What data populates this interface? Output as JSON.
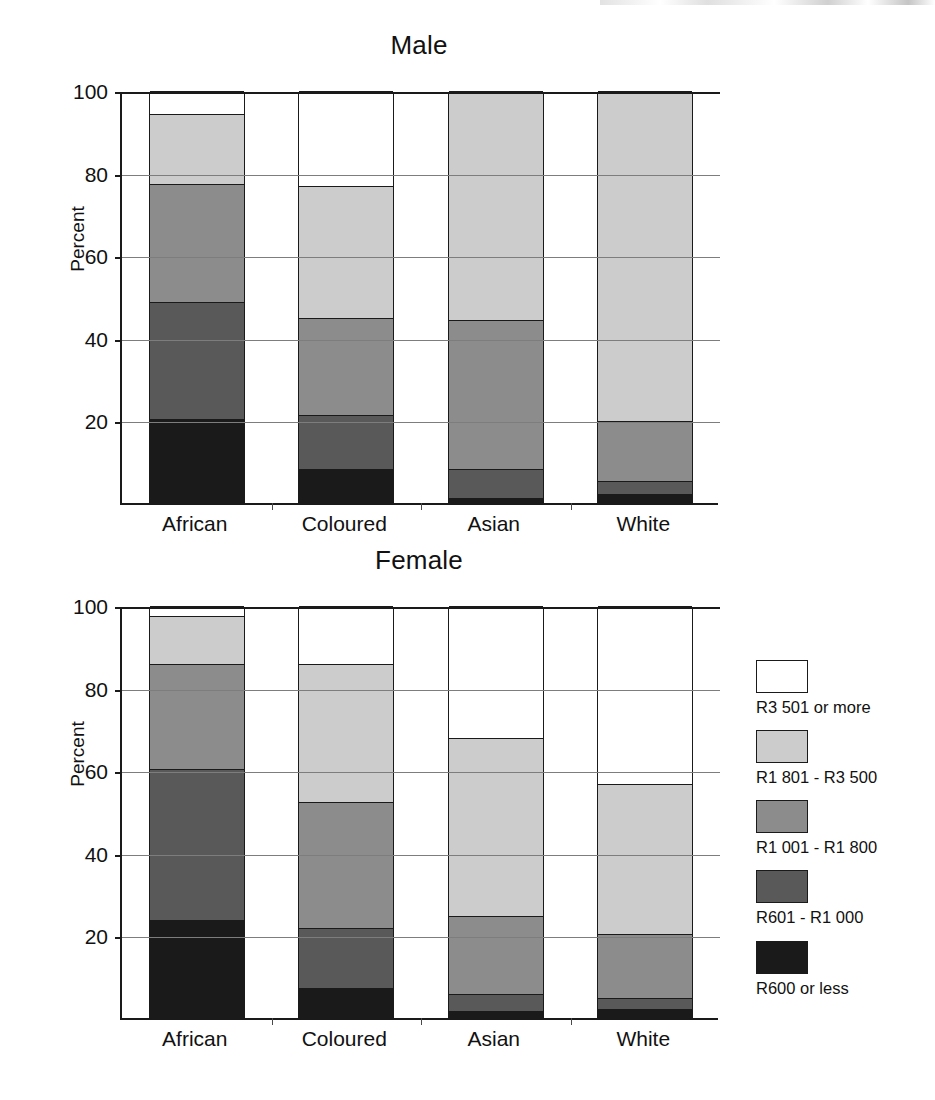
{
  "chart_data": {
    "type": "bar",
    "subtype": "stacked-bar-percent",
    "title": "",
    "panels": [
      {
        "id": "male",
        "title": "Male"
      },
      {
        "id": "female",
        "title": "Female"
      }
    ],
    "categories": [
      "African",
      "Coloured",
      "Asian",
      "White"
    ],
    "xlabel": "",
    "ylabel": "Percent",
    "ylim": [
      0,
      100
    ],
    "yticks": [
      20,
      40,
      60,
      80,
      100
    ],
    "ytick_labels": [
      "20",
      "40",
      "60",
      "80",
      "100"
    ],
    "grid": "horizontal",
    "legend_position": "right",
    "legend_order": "top-to-bottom",
    "series": [
      {
        "name": "R600 or less",
        "color": "#1a1a1a",
        "stack_order": 1,
        "male": [
          20.5,
          8.5,
          1.5,
          2.5
        ],
        "female": [
          24.0,
          7.5,
          2.0,
          2.5
        ]
      },
      {
        "name": "R601 -  R1 000",
        "color": "#595959",
        "stack_order": 2,
        "male": [
          28.5,
          13.0,
          7.0,
          3.0
        ],
        "female": [
          36.5,
          14.5,
          4.0,
          2.5
        ]
      },
      {
        "name": "R1 001 - R1 800",
        "color": "#8c8c8c",
        "stack_order": 3,
        "male": [
          28.5,
          23.5,
          36.0,
          14.5
        ],
        "female": [
          25.5,
          30.5,
          19.0,
          15.5
        ]
      },
      {
        "name": "R1 801 - R3 500",
        "color": "#cccccc",
        "stack_order": 4,
        "male": [
          17.0,
          32.0,
          55.5,
          80.0
        ],
        "female": [
          11.5,
          33.5,
          43.0,
          36.5
        ]
      },
      {
        "name": "R3 501 or more",
        "color": "#ffffff",
        "stack_order": 5,
        "male": [
          5.5,
          23.0,
          0.0,
          0.0
        ],
        "female": [
          2.5,
          14.0,
          32.0,
          43.0
        ]
      }
    ],
    "cumulative_tops": {
      "male": {
        "African": [
          20.5,
          49.0,
          77.5,
          94.5,
          100
        ],
        "Coloured": [
          8.5,
          21.5,
          45.0,
          77.0,
          100
        ],
        "Asian": [
          1.5,
          8.5,
          44.5,
          100,
          100
        ],
        "White": [
          2.5,
          5.5,
          20.0,
          100,
          100
        ]
      },
      "female": {
        "African": [
          24.0,
          60.5,
          86.0,
          97.5,
          100
        ],
        "Coloured": [
          7.5,
          22.0,
          52.5,
          86.0,
          100
        ],
        "Asian": [
          2.0,
          6.0,
          25.0,
          68.0,
          100
        ],
        "White": [
          2.5,
          5.0,
          20.5,
          57.0,
          100
        ]
      }
    }
  },
  "legend": {
    "entries": [
      {
        "label": "R3 501 or more",
        "color": "#ffffff"
      },
      {
        "label": "R1 801 - R3 500",
        "color": "#cccccc"
      },
      {
        "label": "R1 001 - R1 800",
        "color": "#8c8c8c"
      },
      {
        "label": "R601 -  R1 000",
        "color": "#595959"
      },
      {
        "label": "R600 or less",
        "color": "#1a1a1a"
      }
    ]
  }
}
